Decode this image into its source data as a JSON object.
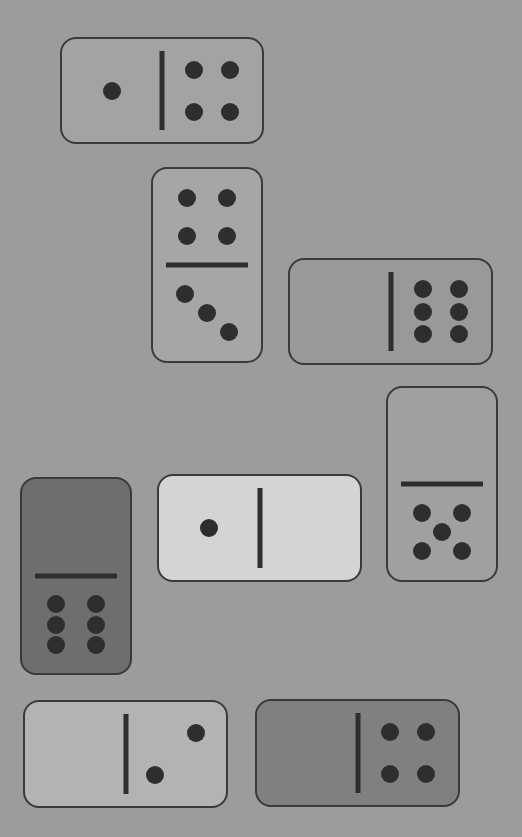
{
  "board": {
    "background_color": "#9c9c9c",
    "pip_color": "#2e2e2e",
    "border_color": "#3a3a3a"
  },
  "dominoes": [
    {
      "id": "d1",
      "orientation": "horizontal",
      "left": 1,
      "right": 4,
      "color": "#a3a3a3",
      "x": 60,
      "y": 37,
      "w": 204,
      "h": 107
    },
    {
      "id": "d2",
      "orientation": "vertical",
      "top": 4,
      "bottom": 3,
      "color": "#a6a6a6",
      "x": 151,
      "y": 167,
      "w": 112,
      "h": 196
    },
    {
      "id": "d3",
      "orientation": "horizontal",
      "left": 0,
      "right": 6,
      "color": "#999999",
      "x": 288,
      "y": 258,
      "w": 205,
      "h": 107
    },
    {
      "id": "d4",
      "orientation": "vertical",
      "top": 0,
      "bottom": 5,
      "color": "#a0a0a0",
      "x": 386,
      "y": 386,
      "w": 112,
      "h": 196
    },
    {
      "id": "d5",
      "orientation": "horizontal",
      "left": 1,
      "right": 0,
      "color": "#d4d4d4",
      "x": 157,
      "y": 474,
      "w": 205,
      "h": 108
    },
    {
      "id": "d6",
      "orientation": "vertical",
      "top": 0,
      "bottom": 6,
      "color": "#6e6e6e",
      "x": 20,
      "y": 477,
      "w": 112,
      "h": 198
    },
    {
      "id": "d7",
      "orientation": "horizontal",
      "left": 0,
      "right": 2,
      "color": "#b3b3b3",
      "x": 23,
      "y": 700,
      "w": 205,
      "h": 108
    },
    {
      "id": "d8",
      "orientation": "horizontal",
      "left": 0,
      "right": 4,
      "color": "#808080",
      "x": 255,
      "y": 699,
      "w": 205,
      "h": 108
    }
  ]
}
